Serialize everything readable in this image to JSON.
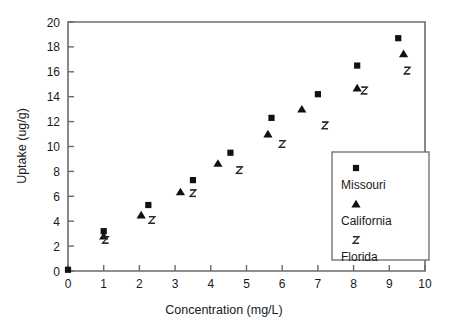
{
  "chart_data": {
    "type": "scatter",
    "title": "",
    "xlabel": "Concentration (mg/L)",
    "ylabel": "Uptake (ug/g)",
    "xlim": [
      0,
      10
    ],
    "ylim": [
      0,
      20
    ],
    "xticks": [
      0,
      1,
      2,
      3,
      4,
      5,
      6,
      7,
      8,
      9,
      10
    ],
    "yticks": [
      0,
      2,
      4,
      6,
      8,
      10,
      12,
      14,
      16,
      18,
      20
    ],
    "xtick_labels": [
      "0",
      "1",
      "2",
      "3",
      "4",
      "5",
      "6",
      "7",
      "8",
      "9",
      "10"
    ],
    "ytick_labels": [
      "0",
      "2",
      "4",
      "6",
      "8",
      "10",
      "12",
      "14",
      "16",
      "18",
      "20"
    ],
    "grid": false,
    "legend_position": "lower-right",
    "series": [
      {
        "name": "Missouri",
        "marker": "filled-square",
        "color": "#111111",
        "points": [
          {
            "x": 0.0,
            "y": 0.1
          },
          {
            "x": 1.0,
            "y": 3.2
          },
          {
            "x": 2.25,
            "y": 5.3
          },
          {
            "x": 3.5,
            "y": 7.3
          },
          {
            "x": 4.55,
            "y": 9.5
          },
          {
            "x": 5.7,
            "y": 12.3
          },
          {
            "x": 7.0,
            "y": 14.2
          },
          {
            "x": 8.1,
            "y": 16.5
          },
          {
            "x": 9.25,
            "y": 18.7
          }
        ]
      },
      {
        "name": "California",
        "marker": "filled-triangle",
        "color": "#111111",
        "points": [
          {
            "x": 1.0,
            "y": 2.8
          },
          {
            "x": 2.05,
            "y": 4.5
          },
          {
            "x": 3.15,
            "y": 6.35
          },
          {
            "x": 4.2,
            "y": 8.65
          },
          {
            "x": 5.6,
            "y": 11.0
          },
          {
            "x": 6.55,
            "y": 13.0
          },
          {
            "x": 8.1,
            "y": 14.7
          },
          {
            "x": 9.4,
            "y": 17.45
          }
        ]
      },
      {
        "name": "Florida",
        "marker": "hourglass",
        "color": "#2a2a2a",
        "points": [
          {
            "x": 1.05,
            "y": 2.5
          },
          {
            "x": 2.35,
            "y": 4.1
          },
          {
            "x": 3.5,
            "y": 6.25
          },
          {
            "x": 4.8,
            "y": 8.1
          },
          {
            "x": 6.0,
            "y": 10.2
          },
          {
            "x": 7.2,
            "y": 11.7
          },
          {
            "x": 8.3,
            "y": 14.5
          },
          {
            "x": 9.5,
            "y": 16.1
          }
        ]
      }
    ],
    "legend_entries": [
      {
        "label": "Missouri",
        "marker": "filled-square"
      },
      {
        "label": "California",
        "marker": "filled-triangle"
      },
      {
        "label": "Florida",
        "marker": "hourglass"
      }
    ]
  },
  "colors": {
    "frame": "#6b6b6b",
    "marker": "#111111",
    "background": "#ffffff",
    "text": "#1a1a1a"
  }
}
